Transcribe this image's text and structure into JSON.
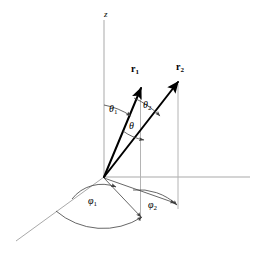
{
  "figure": {
    "kind": "spherical-coordinates-two-vectors-diagram",
    "background_color": "#ffffff",
    "width": 254,
    "height": 253,
    "axis_color": "#a9a9a9",
    "vector_color": "#000000",
    "annotation_color": "#404040"
  },
  "axes": {
    "z": {
      "label": "z",
      "label_x": 104,
      "label_y": 10
    },
    "x": {
      "label": "",
      "label_x": 0,
      "label_y": 0
    },
    "y": {
      "label": "",
      "label_x": 0,
      "label_y": 0
    }
  },
  "vectors": [
    {
      "name": "r1",
      "label_base": "r",
      "label_sub": "1",
      "label_x": 131,
      "label_y": 64,
      "tip_x": 141,
      "tip_y": 88,
      "origin_x": 104,
      "origin_y": 177
    },
    {
      "name": "r2",
      "label_base": "r",
      "label_sub": "2",
      "label_x": 176,
      "label_y": 62,
      "tip_x": 178,
      "tip_y": 82,
      "origin_x": 104,
      "origin_y": 177
    }
  ],
  "angles": [
    {
      "name": "theta1",
      "label_base": "θ",
      "label_sub": "1",
      "label_x": 109,
      "label_y": 104,
      "description": "polar angle of r1 from z-axis"
    },
    {
      "name": "theta2",
      "label_base": "θ",
      "label_sub": "2",
      "label_x": 143,
      "label_y": 100,
      "description": "polar angle of r2 from z-axis"
    },
    {
      "name": "theta",
      "label_base": "θ",
      "label_sub": "",
      "label_x": 129,
      "label_y": 121,
      "description": "angle between r1 and r2"
    },
    {
      "name": "phi1",
      "label_base": "φ",
      "label_sub": "1",
      "label_x": 88,
      "label_y": 196,
      "description": "azimuthal angle of r1 in xy-plane"
    },
    {
      "name": "phi2",
      "label_base": "φ",
      "label_sub": "2",
      "label_x": 148,
      "label_y": 200,
      "description": "azimuthal angle of r2 in xy-plane"
    }
  ]
}
